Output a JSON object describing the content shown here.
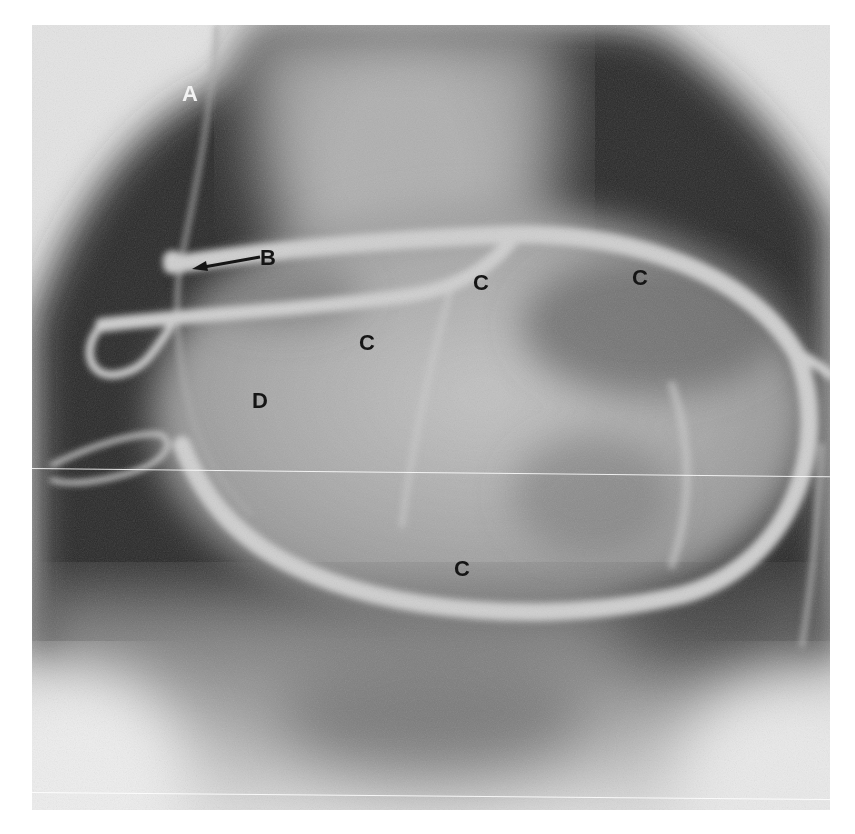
{
  "figure": {
    "type": "coronary-angiogram",
    "tone": "grayscale",
    "colors": {
      "page_background": "#ffffff",
      "lung_field_dark": "#2a2a2a",
      "vessel_contrast": "#c8c8c8",
      "outer_background": "#e6e6e6"
    },
    "labels": [
      {
        "id": "A",
        "text": "A",
        "color": "light",
        "x": 183,
        "y": 84
      },
      {
        "id": "B",
        "text": "B",
        "color": "dark",
        "x": 261,
        "y": 249,
        "has_arrow": true
      },
      {
        "id": "C1",
        "text": "C",
        "color": "dark",
        "x": 473,
        "y": 272
      },
      {
        "id": "C2",
        "text": "C",
        "color": "dark",
        "x": 632,
        "y": 267
      },
      {
        "id": "C3",
        "text": "C",
        "color": "dark",
        "x": 359,
        "y": 332
      },
      {
        "id": "C4",
        "text": "C",
        "color": "dark",
        "x": 454,
        "y": 558
      },
      {
        "id": "D",
        "text": "D",
        "color": "dark",
        "x": 252,
        "y": 390
      }
    ]
  }
}
